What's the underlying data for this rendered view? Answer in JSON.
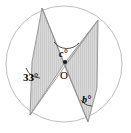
{
  "figure": {
    "background_color": "#ffffff",
    "circle": {
      "name": "outer-circle",
      "center_x": 64,
      "center_y": 64,
      "radius": 58,
      "stroke_color": "#b9b9b9",
      "fill_color": "#ffffff",
      "stroke_width": 1
    },
    "wedges": [
      {
        "name": "left-wedge",
        "apex_top_x": 42,
        "apex_top_y": 8,
        "vertex_x": 32,
        "vertex_y": 62,
        "apex_bottom_x": 30,
        "apex_bottom_y": 115,
        "centre_x": 64,
        "centre_y": 64,
        "fill_color": "#d6d6d6",
        "stroke_color": "#8a8a8a"
      },
      {
        "name": "right-wedge",
        "apex_top_x": 98,
        "apex_top_y": 20,
        "vertex_x": 97,
        "vertex_y": 88,
        "apex_bottom_x": 88,
        "apex_bottom_y": 122,
        "centre_x": 64,
        "centre_y": 64,
        "fill_color": "#d6d6d6",
        "stroke_color": "#8a8a8a"
      }
    ],
    "centre_point": {
      "name": "centre-dot",
      "x": 65,
      "y": 62,
      "radius": 2,
      "color": "#1a1a1a"
    },
    "labels": {
      "angle_33": "33°",
      "angle_c": "c°",
      "angle_b": "b°",
      "centre": "O"
    },
    "arcs": {
      "c_arc_color": "#3a3a3a",
      "b_arc_color": "#3a3a3a",
      "angle33_arc_color": "#3a3a3a"
    }
  }
}
